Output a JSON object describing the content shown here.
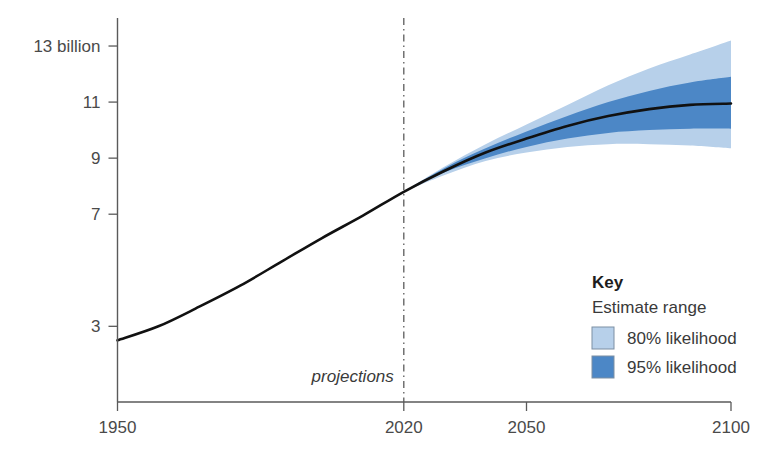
{
  "chart_data": {
    "type": "area",
    "title": "",
    "subtitle": "",
    "xlabel": "",
    "ylabel": "",
    "grid": false,
    "xlim": [
      1950,
      2100
    ],
    "ylim": [
      0.3,
      14.0
    ],
    "x_ticks": [
      1950,
      2020,
      2050,
      2100
    ],
    "x_tick_labels": [
      "1950",
      "2020",
      "2050",
      "2100"
    ],
    "y_ticks": [
      3,
      7,
      9,
      11,
      13
    ],
    "y_tick_labels": [
      "3",
      "7",
      "9",
      "11",
      "13 billion"
    ],
    "y_unit": "billion",
    "annotations": [
      {
        "name": "projections-divider",
        "type": "vline",
        "x": 2020,
        "label": "projections"
      }
    ],
    "series": [
      {
        "name": "World population (estimate and median projection)",
        "type": "line",
        "color": "#111111",
        "x": [
          1950,
          1960,
          1970,
          1980,
          1990,
          2000,
          2010,
          2020,
          2030,
          2040,
          2050,
          2060,
          2070,
          2080,
          2090,
          2100
        ],
        "values": [
          2.5,
          3.0,
          3.7,
          4.45,
          5.3,
          6.15,
          6.95,
          7.8,
          8.55,
          9.2,
          9.7,
          10.15,
          10.5,
          10.75,
          10.9,
          10.95
        ]
      },
      {
        "name": "80% likelihood",
        "type": "band",
        "color": "#b7d0ea",
        "x": [
          2020,
          2030,
          2040,
          2050,
          2060,
          2070,
          2080,
          2090,
          2100
        ],
        "lower": [
          7.8,
          8.4,
          8.9,
          9.2,
          9.4,
          9.5,
          9.5,
          9.45,
          9.35
        ],
        "upper": [
          7.8,
          8.7,
          9.5,
          10.2,
          10.9,
          11.6,
          12.2,
          12.7,
          13.2
        ]
      },
      {
        "name": "95% likelihood",
        "type": "band",
        "color": "#4c87c6",
        "x": [
          2020,
          2030,
          2040,
          2050,
          2060,
          2070,
          2080,
          2090,
          2100
        ],
        "lower": [
          7.8,
          8.5,
          9.0,
          9.4,
          9.7,
          9.9,
          10.0,
          10.05,
          10.05
        ],
        "upper": [
          7.8,
          8.65,
          9.35,
          9.95,
          10.5,
          11.0,
          11.4,
          11.7,
          11.9
        ]
      }
    ]
  },
  "legend": {
    "position": "inside-bottom-right",
    "title": "Key",
    "subtitle": "Estimate range",
    "items": [
      {
        "label": "80% likelihood",
        "color": "#b7d0ea"
      },
      {
        "label": "95% likelihood",
        "color": "#4c87c6"
      }
    ]
  },
  "colors": {
    "band_80": "#b7d0ea",
    "band_95": "#4c87c6",
    "line": "#111111",
    "axis": "#5a5a5a",
    "text": "#3a3a3a",
    "background": "#ffffff"
  }
}
